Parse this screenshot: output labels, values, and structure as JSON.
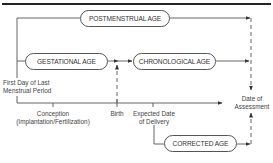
{
  "diagram": {
    "boxes": {
      "postmenstrual": "POSTMENSTRUAL AGE",
      "gestational": "GESTATIONAL AGE",
      "chronological": "CHRONOLOGICAL AGE",
      "corrected": "CORRECTED AGE"
    },
    "labels": {
      "lmp": [
        "First Day of Last",
        "Menstrual Period"
      ],
      "conception": [
        "Conception",
        "(Implantation/Fertilization)"
      ],
      "birth": "Birth",
      "edd": [
        "Expected Date",
        "of Delivery"
      ],
      "assessment": [
        "Date of",
        "Assessment"
      ]
    },
    "colors": {
      "line": "#444444",
      "rule": "#222222"
    }
  }
}
